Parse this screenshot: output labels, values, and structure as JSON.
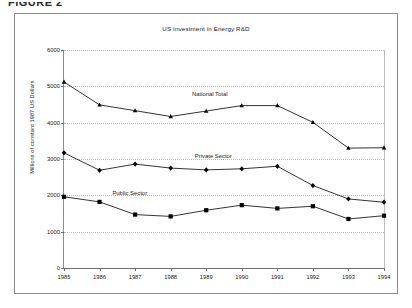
{
  "figure": {
    "caption": "FIGURE 2"
  },
  "chart_data": {
    "type": "line",
    "title": "US Investment in Energy R&D",
    "xlabel": "",
    "ylabel": "Millions of constant 1987 US Dollars",
    "categories": [
      "1985",
      "1986",
      "1987",
      "1988",
      "1989",
      "1990",
      "1991",
      "1992",
      "1993",
      "1994"
    ],
    "x": [
      1985,
      1986,
      1987,
      1988,
      1989,
      1990,
      1991,
      1992,
      1993,
      1994
    ],
    "ylim": [
      0,
      6000
    ],
    "yticks": [
      0,
      1000,
      2000,
      3000,
      4000,
      5000,
      6000
    ],
    "ytick_labels": [
      "0",
      "1000",
      "2000",
      "3000",
      "4000",
      "5000",
      "6000"
    ],
    "grid": true,
    "grid_style": "dotted-horizontal",
    "legend_position": "inline-annotations",
    "series": [
      {
        "name": "National Total",
        "marker": "triangle",
        "color": "#000000",
        "values": [
          5120,
          4490,
          4330,
          4170,
          4320,
          4470,
          4470,
          4010,
          3300,
          3310
        ],
        "label_x": 1989.1,
        "label_y": 4870
      },
      {
        "name": "Private Sector",
        "marker": "diamond",
        "color": "#000000",
        "values": [
          3170,
          2690,
          2860,
          2750,
          2700,
          2730,
          2800,
          2270,
          1900,
          1810
        ],
        "label_x": 1989.2,
        "label_y": 3160
      },
      {
        "name": "Public Sector",
        "marker": "square",
        "color": "#000000",
        "values": [
          1960,
          1820,
          1470,
          1420,
          1590,
          1730,
          1640,
          1700,
          1350,
          1440
        ],
        "label_x": 1986.85,
        "label_y": 2150
      }
    ]
  }
}
